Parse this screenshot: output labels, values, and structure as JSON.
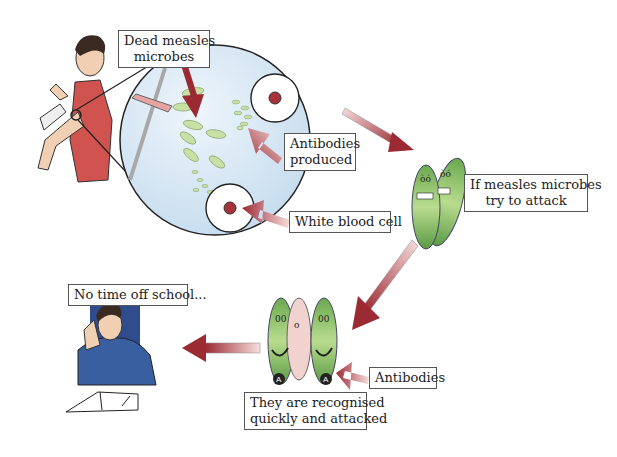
{
  "labels": {
    "dead_microbes": [
      "Dead measles",
      "microbes"
    ],
    "antibodies_produced": [
      "Antibodies",
      "produced"
    ],
    "white_blood_cell": "White blood cell",
    "if_attack": [
      "If measles microbes",
      "try to attack"
    ],
    "antibodies": "Antibodies",
    "recognised": [
      "They are recognised",
      "quickly and attacked"
    ],
    "no_time_off": "No time off school..."
  },
  "colors": {
    "circle_fill": "#d6e6f2",
    "microbe_green": "#8cc06a",
    "arrow_red": "#a8323a",
    "arrow_light": "#f1c6c6",
    "shirt_blue": "#3a5fa0"
  }
}
